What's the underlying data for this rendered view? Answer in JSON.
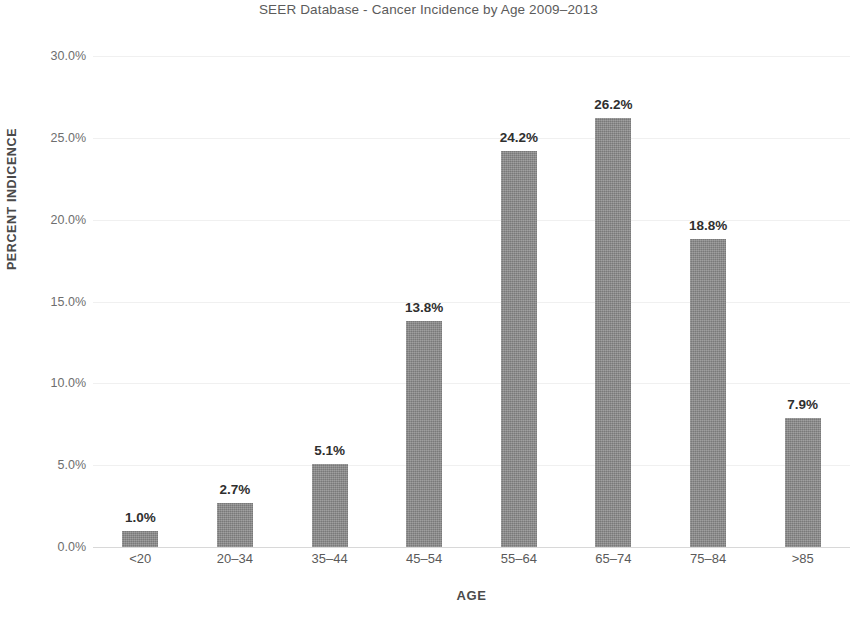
{
  "chart_data": {
    "type": "bar",
    "title": "SEER Database - Cancer Incidence by Age 2009–2013",
    "xlabel": "AGE",
    "ylabel": "PERCENT INDICENCE",
    "categories": [
      "<20",
      "20–34",
      "35–44",
      "45–54",
      "55–64",
      "65–74",
      "75–84",
      ">85"
    ],
    "values": [
      1.0,
      2.7,
      5.1,
      13.8,
      24.2,
      26.2,
      18.8,
      7.9
    ],
    "value_labels": [
      "1.0%",
      "2.7%",
      "5.1%",
      "13.8%",
      "24.2%",
      "26.2%",
      "18.8%",
      "7.9%"
    ],
    "ylim": [
      0,
      30
    ],
    "ytick_values": [
      0,
      5,
      10,
      15,
      20,
      25,
      30
    ],
    "ytick_labels": [
      "0.0%",
      "5.0%",
      "10.0%",
      "15.0%",
      "20.0%",
      "25.0%",
      "30.0%"
    ],
    "grid": true,
    "legend": "none",
    "series": [
      {
        "name": "Percent Incidence",
        "color": "#8a8a8a",
        "values": [
          1.0,
          2.7,
          5.1,
          13.8,
          24.2,
          26.2,
          18.8,
          7.9
        ]
      }
    ],
    "colors": {
      "bar": "#8a8a8a",
      "title_text": "#5b5b5b",
      "axis_text": "#5a5a5a",
      "axis_title_text": "#4a4a4a",
      "value_label_text": "#2f2f2f",
      "gridline": "#f0f0f0",
      "baseline": "#d8d8d8",
      "background": "#ffffff"
    }
  }
}
